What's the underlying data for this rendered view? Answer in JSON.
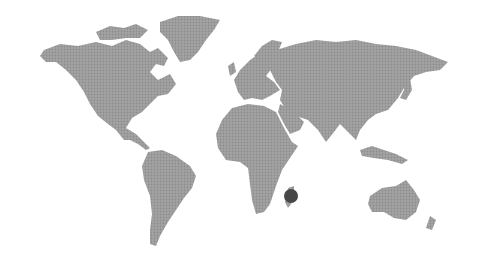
{
  "map": {
    "style": "dotted-grayscale-world",
    "background_color": "#ffffff",
    "land_color": "#9c9c9c",
    "land_texture_color": "#8a8a8a",
    "marker": {
      "label": "",
      "location_hint": "Madagascar",
      "cx": 291,
      "cy": 196,
      "r": 7,
      "color": "#474747"
    }
  }
}
